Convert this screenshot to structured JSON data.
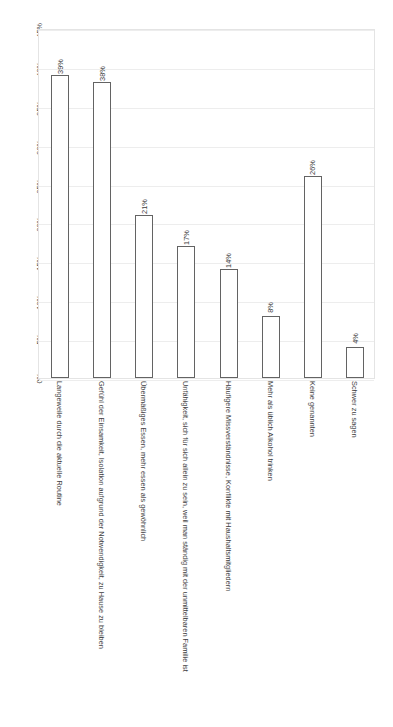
{
  "chart_data": {
    "type": "bar",
    "title": "",
    "subtitle": "",
    "xlabel": "",
    "ylabel": "",
    "ylim": [
      0,
      45
    ],
    "grid": true,
    "legend": "none",
    "orientation": "vertical",
    "bar_style": "outlined",
    "categories": [
      "Langeweile durch die aktuelle Routine",
      "Gefühl der Einsamkeit, Isolation aufgrund der Notwendigkeit, zu Hause zu bleiben",
      "Übermäßiges Essen, mehr essen als gewöhnlich",
      "Unfähigkeit, sich für sich allein zu sein, weil man ständig mit der unmittelbaren Familie ist",
      "Häufigere Missverständnisse, Konflikte mit Haushaltsmitgliedern",
      "Mehr als üblich Alkohol trinken",
      "Keine genannten",
      "Schwer zu sagen"
    ],
    "values": [
      39,
      38,
      21,
      17,
      14,
      8,
      26,
      4
    ],
    "data_labels": [
      "39%",
      "38%",
      "21%",
      "17%",
      "14%",
      "8%",
      "26%",
      "4%"
    ],
    "ytick_values": [
      0,
      5,
      10,
      15,
      20,
      25,
      30,
      35,
      40,
      45
    ],
    "ytick_labels": [
      "0%",
      "5%",
      "10%",
      "15%",
      "20%",
      "25%",
      "30%",
      "35%",
      "40%",
      "45%"
    ],
    "colors": {
      "bar_fill": "#ffffff",
      "bar_border": "#636363",
      "gridline": "#ededed",
      "plot_border": "#e4e4e4",
      "text": "#3d3d3d",
      "background": "#ffffff"
    }
  }
}
